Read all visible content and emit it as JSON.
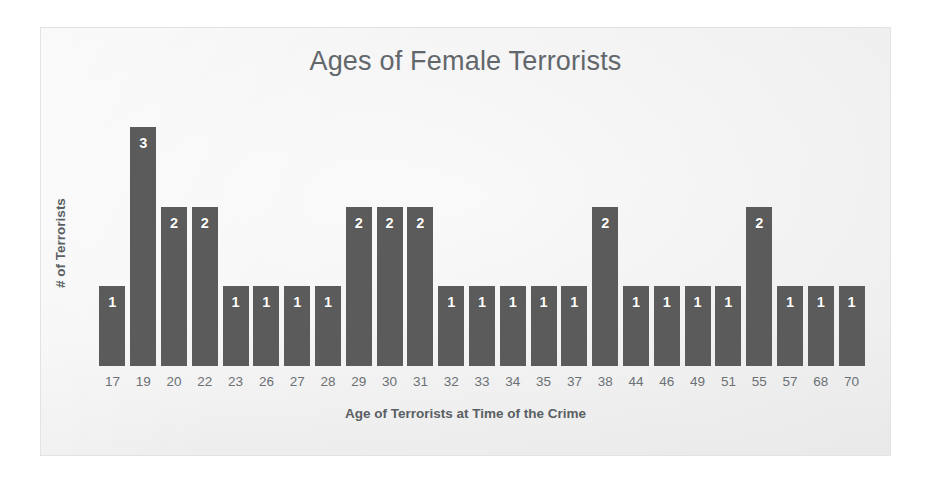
{
  "chart_data": {
    "type": "bar",
    "title": "Ages of Female Terrorists",
    "xlabel": "Age of Terrorists at Time of the Crime",
    "ylabel": "# of Terrorists",
    "categories": [
      "17",
      "19",
      "20",
      "22",
      "23",
      "26",
      "27",
      "28",
      "29",
      "30",
      "31",
      "32",
      "33",
      "34",
      "35",
      "37",
      "38",
      "44",
      "46",
      "49",
      "51",
      "55",
      "57",
      "68",
      "70"
    ],
    "values": [
      1,
      3,
      2,
      2,
      1,
      1,
      1,
      1,
      2,
      2,
      2,
      1,
      1,
      1,
      1,
      1,
      2,
      1,
      1,
      1,
      1,
      2,
      1,
      1,
      1
    ],
    "data_labels": [
      "1",
      "3",
      "2",
      "2",
      "1",
      "1",
      "1",
      "1",
      "2",
      "2",
      "2",
      "1",
      "1",
      "1",
      "1",
      "1",
      "2",
      "1",
      "1",
      "1",
      "1",
      "2",
      "1",
      "1",
      "1"
    ],
    "ylim": [
      0,
      3.3
    ],
    "grid": false,
    "legend": false,
    "axis_line_visible": false,
    "y_tick_labels": [],
    "bar_color": "#5b5b5b",
    "data_label_color": "#ffffff",
    "title_color": "#62676c",
    "axis_text_color": "#6b7075",
    "plot_background": "#f3f3f3",
    "border_color": "#e3e3e3"
  }
}
